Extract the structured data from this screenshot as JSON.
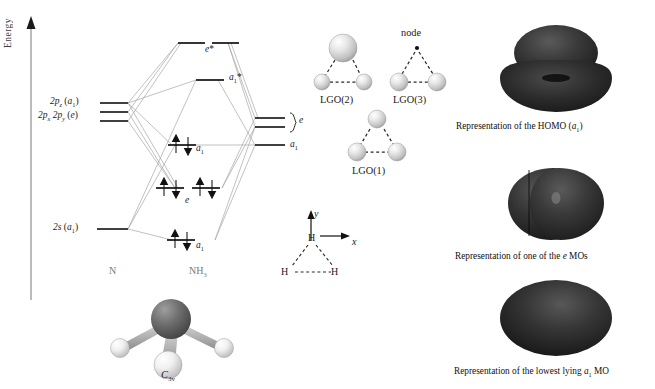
{
  "figure": {
    "axis": {
      "label": "Energy"
    }
  },
  "mo_diagram": {
    "left_fragment_label": "N",
    "center_fragment_label": "NH3",
    "atomic_orbitals": [
      {
        "id": "2pz",
        "label_html": "2p_z (a_1)",
        "energy_y": 103
      },
      {
        "id": "2px2py",
        "label_html": "2p_x, 2p_y (e)",
        "energy_y": 117
      },
      {
        "id": "2s",
        "label_html": "2s (a_1)",
        "energy_y": 229
      }
    ],
    "molecular_orbitals": [
      {
        "id": "e-star",
        "label": "e*",
        "occupancy": 0,
        "y": 43
      },
      {
        "id": "a1-star",
        "label": "a1*",
        "occupancy": 0,
        "y": 80
      },
      {
        "id": "a1-homo",
        "label": "a1",
        "occupancy": 2,
        "y": 145
      },
      {
        "id": "e-bond",
        "label": "e",
        "occupancy": 4,
        "y": 188
      },
      {
        "id": "a1-low",
        "label": "a1",
        "occupancy": 2,
        "y": 240
      }
    ],
    "ligand_group_levels": [
      {
        "id": "lgo-e-upper",
        "y": 118
      },
      {
        "id": "lgo-e-lower",
        "y": 127
      },
      {
        "id": "lgo-a1",
        "y": 145,
        "label": "a1"
      }
    ],
    "lgo_bracket_label": "e",
    "electron_arrow_up": "↑",
    "electron_arrow_down": "↓"
  },
  "lgo_panel": {
    "items": [
      {
        "id": "lgo2",
        "caption": "LGO(2)",
        "node_label": null,
        "spheres": [
          {
            "cx": 343,
            "cy": 48,
            "r": 14
          },
          {
            "cx": 322,
            "cy": 82,
            "r": 8
          },
          {
            "cx": 364,
            "cy": 82,
            "r": 8
          }
        ]
      },
      {
        "id": "lgo3",
        "caption": "LGO(3)",
        "node_label": "node",
        "spheres": [
          {
            "cx": 399,
            "cy": 82,
            "r": 9
          },
          {
            "cx": 437,
            "cy": 82,
            "r": 9
          }
        ]
      },
      {
        "id": "lgo1",
        "caption": "LGO(1)",
        "node_label": null,
        "spheres": [
          {
            "cx": 377,
            "cy": 119,
            "r": 9
          },
          {
            "cx": 357,
            "cy": 152,
            "r": 9
          },
          {
            "cx": 397,
            "cy": 152,
            "r": 9
          }
        ]
      }
    ]
  },
  "axes_inset": {
    "x_label": "x",
    "y_label": "y",
    "atoms": [
      {
        "label": "H",
        "x": 313,
        "y": 238
      },
      {
        "label": "H",
        "x": 288,
        "y": 272
      },
      {
        "label": "H",
        "x": 338,
        "y": 272
      }
    ]
  },
  "molecule_model": {
    "caption": "C3v",
    "caption_main": "C",
    "caption_sub": "3v"
  },
  "orbital_renders": [
    {
      "id": "homo",
      "caption_pre": "Representation of the HOMO (",
      "caption_it": "a",
      "caption_sub": "1",
      "caption_post": ")",
      "caption_full": "Representation of the HOMO (a1)"
    },
    {
      "id": "e-mo",
      "caption_pre": "Representation of one of the ",
      "caption_it": "e",
      "caption_sub": "",
      "caption_post": " MOs",
      "caption_full": "Representation of one of the e MOs"
    },
    {
      "id": "a1-low",
      "caption_pre": "Representation of the lowest lying ",
      "caption_it": "a",
      "caption_sub": "1",
      "caption_post": " MO",
      "caption_full": "Representation of the lowest lying a1 MO"
    }
  ],
  "colors": {
    "level_line": "#111111",
    "correlation_line": "#9a9a9a",
    "axis": "#808080",
    "sphere_light": "#f2f2f2",
    "sphere_mid": "#c9c9c9",
    "sphere_dark": "#9a9a9a",
    "orbital_dark": "#2b2b2b",
    "orbital_darker": "#1a1a1a",
    "nitrogen": "#6b6b6b",
    "hydrogen": "#f0f0f0",
    "text": "#111111"
  }
}
